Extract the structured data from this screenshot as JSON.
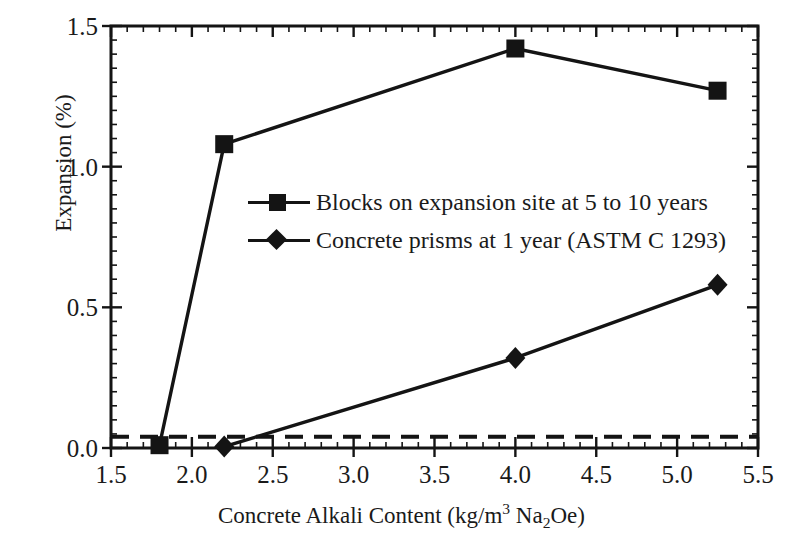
{
  "chart_data": {
    "type": "line",
    "title": "",
    "xlabel_parts": {
      "pre": "Concrete Alkali Content (kg/m",
      "sup": "3",
      "mid": " Na",
      "sub": "2",
      "post": "Oe)"
    },
    "xlabel": "Concrete Alkali Content (kg/m3 Na2Oe)",
    "ylabel": "Expansion (%)",
    "xlim": [
      1.5,
      5.5
    ],
    "ylim": [
      0.0,
      1.5
    ],
    "xticks": [
      "1.5",
      "2.0",
      "2.5",
      "3.0",
      "3.5",
      "4.0",
      "4.5",
      "5.0",
      "5.5"
    ],
    "xtick_values": [
      1.5,
      2.0,
      2.5,
      3.0,
      3.5,
      4.0,
      4.5,
      5.0,
      5.5
    ],
    "yticks": [
      "0.0",
      "0.5",
      "1.0",
      "1.5"
    ],
    "ytick_values": [
      0.0,
      0.5,
      1.0,
      1.5
    ],
    "x_minor_step": 0.1,
    "y_minor_step": 0.05,
    "grid": false,
    "legend_position": "center-left-inside",
    "series": [
      {
        "name": "Blocks on expansion site at 5 to 10 years",
        "marker": "square",
        "color": "#141414",
        "x": [
          1.8,
          2.2,
          4.0,
          5.25
        ],
        "y": [
          0.01,
          1.08,
          1.42,
          1.27
        ]
      },
      {
        "name": "Concrete prisms at 1 year (ASTM C 1293)",
        "marker": "diamond",
        "color": "#141414",
        "x": [
          2.2,
          4.0,
          5.25
        ],
        "y": [
          0.005,
          0.32,
          0.58
        ]
      }
    ],
    "reference_lines": [
      {
        "name": "expansion-threshold",
        "orientation": "horizontal",
        "value": 0.04,
        "style": "dashed",
        "color": "#141414"
      }
    ]
  }
}
